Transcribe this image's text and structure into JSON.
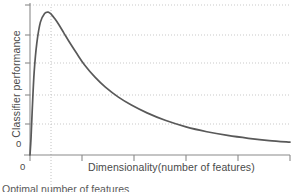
{
  "chart_data": {
    "type": "line",
    "title": "",
    "subtitle": "",
    "xlabel": "Dimensionality(number of features)",
    "ylabel": "Classifier performance",
    "x_tick_labels": [
      "0"
    ],
    "y_tick_labels": [
      "0"
    ],
    "xlim": [
      0,
      100
    ],
    "ylim": [
      0,
      1.05
    ],
    "grid": true,
    "grid_style": "dotted",
    "legend": null,
    "legend_position": "none",
    "annotations": [
      {
        "name": "optimal-number-of-features",
        "text": "Optimal number of features",
        "x": 8,
        "marker": "vertical-dotted-line"
      }
    ],
    "series": [
      {
        "name": "classifier performance vs dimensionality",
        "color": "#595959",
        "x": [
          0,
          0.4,
          0.9,
          1.6,
          2.6,
          4.0,
          5.6,
          7.0,
          8.2,
          9.5,
          11.0,
          13.0,
          15.5,
          18.0,
          21.0,
          25.0,
          29.0,
          34.0,
          39.0,
          45.0,
          52.0,
          60.0,
          68.0,
          76.0,
          84.0,
          92.0,
          100.0
        ],
        "y": [
          0.0,
          0.12,
          0.33,
          0.58,
          0.78,
          0.93,
          0.99,
          1.0,
          0.985,
          0.955,
          0.915,
          0.855,
          0.78,
          0.71,
          0.63,
          0.545,
          0.475,
          0.405,
          0.35,
          0.295,
          0.243,
          0.197,
          0.163,
          0.137,
          0.117,
          0.101,
          0.09
        ]
      }
    ],
    "gridlines_y": [
      0.2,
      0.4,
      0.6,
      0.8,
      1.0
    ],
    "peak": {
      "x": 7.0,
      "y": 1.0
    }
  },
  "figure": {
    "x_axis_label": "Dimensionality(number of features)",
    "y_axis_label": "Classifier performance",
    "x_origin_tick": "0",
    "y_origin_tick": "0",
    "optimal_annotation": "Optimal number of features"
  },
  "colors": {
    "curve": "#595959",
    "axis": "#8a8a8a",
    "gridline": "#c9c9c9",
    "text": "#4a4a4a",
    "background": "#ffffff"
  }
}
